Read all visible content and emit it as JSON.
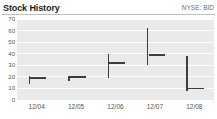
{
  "header": {
    "title": "Stock History",
    "ticker": "NYSE: BID"
  },
  "chart_data": {
    "type": "bar",
    "title": "Stock History",
    "subtitle": "NYSE: BID",
    "xlabel": "",
    "ylabel": "",
    "ylim": [
      0,
      70
    ],
    "yticks": [
      0,
      10,
      20,
      30,
      40,
      50,
      60,
      70
    ],
    "ytick_labels": [
      "0",
      "10",
      "20",
      "30",
      "40",
      "50",
      "60",
      "70"
    ],
    "grid": true,
    "legend": "none",
    "categories": [
      "12/04",
      "12/05",
      "12/06",
      "12/07",
      "12/08"
    ],
    "series": [
      {
        "name": "High",
        "values": [
          21,
          21,
          40,
          62,
          38
        ]
      },
      {
        "name": "Low",
        "values": [
          14,
          16,
          19,
          30,
          8
        ]
      },
      {
        "name": "Close",
        "values": [
          19,
          20,
          32,
          39,
          10
        ]
      }
    ],
    "bars": [
      {
        "category": "12/04",
        "low": 14,
        "high": 21,
        "close": 19,
        "close_side": "right"
      },
      {
        "category": "12/05",
        "low": 16,
        "high": 21,
        "close": 20,
        "close_side": "right"
      },
      {
        "category": "12/06",
        "low": 19,
        "high": 40,
        "close": 32,
        "close_side": "right"
      },
      {
        "category": "12/07",
        "low": 30,
        "high": 62,
        "close": 39,
        "close_side": "right"
      },
      {
        "category": "12/08",
        "low": 8,
        "high": 38,
        "close": 10,
        "close_side": "right"
      }
    ],
    "colors": {
      "plot_background": "#eaeaea",
      "gridline": "#ffffff",
      "marker": "#3d3d3d",
      "axis_text": "#555555",
      "title_text": "#1d1d1d",
      "ticker_text": "#6e6e6e",
      "rule": "#bfbfbf"
    }
  }
}
